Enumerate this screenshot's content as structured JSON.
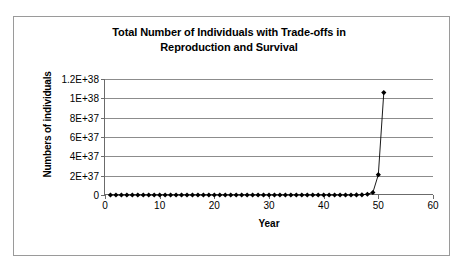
{
  "chart_data": {
    "type": "line",
    "title": "Total Number of Individuals with Trade-offs in Reproduction and Survival",
    "title_line1": "Total Number of Individuals with Trade-offs in",
    "title_line2": "Reproduction and Survival",
    "xlabel": "Year",
    "ylabel": "Numbers of individuals",
    "xlim": [
      0,
      60
    ],
    "ylim": [
      0,
      1.2e+38
    ],
    "xticks": [
      0,
      10,
      20,
      30,
      40,
      50,
      60
    ],
    "xtick_labels": [
      "0",
      "10",
      "20",
      "30",
      "40",
      "50",
      "60"
    ],
    "yticks": [
      0,
      2e+37,
      4e+37,
      6e+37,
      8e+37,
      1e+38,
      1.2e+38
    ],
    "ytick_labels": [
      "0",
      "2E+37",
      "4E+37",
      "6E+37",
      "8E+37",
      "1E+38",
      "1.2E+38"
    ],
    "grid": "horizontal",
    "legend": "none",
    "marker": "filled-diamond",
    "line_color": "#000000",
    "marker_color": "#000000",
    "series": [
      {
        "name": "Total individuals",
        "x": [
          1,
          2,
          3,
          4,
          5,
          6,
          7,
          8,
          9,
          10,
          11,
          12,
          13,
          14,
          15,
          16,
          17,
          18,
          19,
          20,
          21,
          22,
          23,
          24,
          25,
          26,
          27,
          28,
          29,
          30,
          31,
          32,
          33,
          34,
          35,
          36,
          37,
          38,
          39,
          40,
          41,
          42,
          43,
          44,
          45,
          46,
          47,
          48,
          49,
          50,
          51
        ],
        "values": [
          1e+30,
          1e+30,
          1e+30,
          1e+30,
          1e+30,
          1e+30,
          1e+30,
          1e+30,
          1e+30,
          1e+30,
          1e+30,
          1e+30,
          1e+30,
          1e+30,
          1e+30,
          1e+30,
          1e+30,
          1e+30,
          1e+30,
          1e+30,
          1e+30,
          1e+30,
          1e+30,
          1e+30,
          1e+30,
          1e+30,
          1e+30,
          1e+30,
          1e+30,
          1e+30,
          1e+30,
          1e+30,
          1e+30,
          1e+30,
          1e+30,
          1e+30,
          1e+30,
          1e+30,
          1e+30,
          1e+30,
          1e+30,
          1e+30,
          1e+30,
          1e+30,
          1e+30,
          5e+34,
          2e+35,
          8e+35,
          2.6e+36,
          2.1e+37,
          1.06e+38
        ]
      }
    ]
  }
}
